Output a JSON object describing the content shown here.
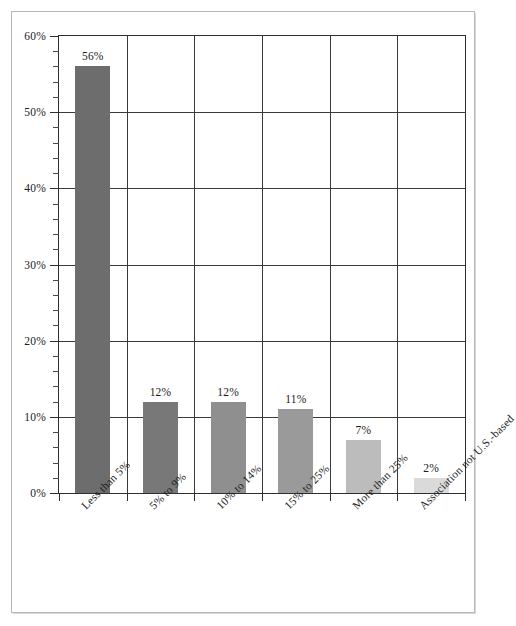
{
  "chart_data": {
    "type": "bar",
    "title": "",
    "subtitle": "",
    "xlabel": "",
    "ylabel": "",
    "categories": [
      "Less than 5%",
      "5% to 9%",
      "10% to 14%",
      "15% to 25%",
      "More than 25%",
      "Association not U.S.-based"
    ],
    "values": [
      56,
      12,
      12,
      11,
      7,
      2
    ],
    "data_labels": [
      "56%",
      "12%",
      "12%",
      "11%",
      "7%",
      "2%"
    ],
    "bar_colors": [
      "#6d6d6d",
      "#787878",
      "#8f8f8f",
      "#9a9a9a",
      "#bcbcbc",
      "#dadada"
    ],
    "ylim": [
      0,
      60
    ],
    "y_ticks": [
      0,
      10,
      20,
      30,
      40,
      50,
      60
    ],
    "y_tick_labels": [
      "0%",
      "10%",
      "20%",
      "30%",
      "40%",
      "50%",
      "60%"
    ],
    "y_minor_tick_step": 2,
    "grid": {
      "horizontal": true,
      "vertical": true,
      "color": "#3a3a3a"
    },
    "legend": {
      "visible": false,
      "position": "none",
      "entries": []
    },
    "plot_border_color": "#2e2e2e",
    "frame_border_color": "#b7b7b7",
    "background_color": "#ffffff",
    "label_rotation_degrees": -45,
    "annotations": []
  }
}
